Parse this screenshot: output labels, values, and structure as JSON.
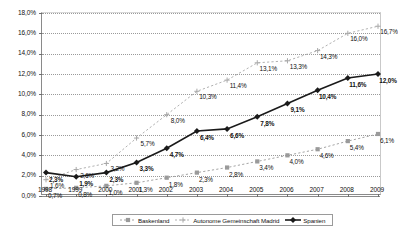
{
  "chart_data": {
    "type": "line",
    "title": "",
    "subtitle": "",
    "xlabel": "",
    "ylabel": "",
    "grid": true,
    "legend_position": "bottom",
    "ylim": [
      0,
      18
    ],
    "ytick_labels": [
      "0,0%",
      "2,0%",
      "4,0%",
      "6,0%",
      "8,0%",
      "10,0%",
      "12,0%",
      "14,0%",
      "16,0%",
      "18,0%"
    ],
    "ytick_values": [
      0,
      2,
      4,
      6,
      8,
      10,
      12,
      14,
      16,
      18
    ],
    "categories": [
      "1998",
      "1999",
      "2000",
      "2001",
      "2002",
      "2003",
      "2004",
      "2005",
      "2006",
      "2007",
      "2008",
      "2009"
    ],
    "x": [
      1998,
      1999,
      2000,
      2001,
      2002,
      2003,
      2004,
      2005,
      2006,
      2007,
      2008,
      2009
    ],
    "series": [
      {
        "name": "Baskenland",
        "marker": "square",
        "color": "#9a9a9a",
        "line_style": "dotted",
        "values": [
          0.7,
          0.8,
          1.0,
          1.3,
          1.8,
          2.3,
          2.8,
          3.4,
          4.0,
          4.6,
          5.4,
          6.1
        ],
        "labels": [
          "0,7%",
          "0,8%",
          "1,0%",
          "1,3%",
          "1,8%",
          "2,3%",
          "2,8%",
          "3,4%",
          "4,0%",
          "4,6%",
          "5,4%",
          "6,1%"
        ]
      },
      {
        "name": "Autonome Gemeinschaft Madrid",
        "marker": "cross",
        "color": "#a8a8a8",
        "line_style": "dotted",
        "values": [
          1.6,
          2.6,
          3.2,
          5.7,
          8.0,
          10.3,
          11.4,
          13.1,
          13.3,
          14.3,
          16.0,
          16.7
        ],
        "labels": [
          "1,6%",
          "2,6%",
          "3,2%",
          "5,7%",
          "8,0%",
          "10,3%",
          "11,4%",
          "13,1%",
          "13,3%",
          "14,3%",
          "16,0%",
          "16,7%"
        ]
      },
      {
        "name": "Spanien",
        "marker": "diamond",
        "color": "#1a1a1a",
        "line_style": "solid",
        "values": [
          2.3,
          1.9,
          2.3,
          3.3,
          4.7,
          6.4,
          6.6,
          7.8,
          9.1,
          10.4,
          11.6,
          12.0
        ],
        "labels": [
          "2,3%",
          "1,9%",
          "2,3%",
          "3,3%",
          "4,7%",
          "6,4%",
          "6,6%",
          "7,8%",
          "9,1%",
          "10,4%",
          "11,6%",
          "12,0%"
        ]
      }
    ]
  },
  "legend": {
    "items": [
      {
        "label": "Baskenland"
      },
      {
        "label": "Autonome Gemeinschaft Madrid"
      },
      {
        "label": "Spanien"
      }
    ]
  },
  "caption": {
    "text": ""
  }
}
